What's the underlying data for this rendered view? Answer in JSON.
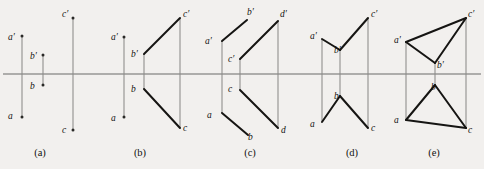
{
  "figure": {
    "background_color": "#f2f0ee",
    "axis_color": "#6b6a68",
    "edge_color": "#161513",
    "projector_color": "#8c8b89",
    "width": 484,
    "height": 169,
    "axis_y": 74
  },
  "panels": [
    {
      "id": "a",
      "caption": "(a)",
      "caption_x": 40,
      "caption_y": 156,
      "labels": [
        {
          "text": "a′",
          "x": 8,
          "y": 40
        },
        {
          "text": "b′",
          "x": 30,
          "y": 59
        },
        {
          "text": "b",
          "x": 30,
          "y": 89
        },
        {
          "text": "a",
          "x": 8,
          "y": 119
        },
        {
          "text": "c′",
          "x": 62,
          "y": 17
        },
        {
          "text": "c",
          "x": 62,
          "y": 133
        }
      ]
    },
    {
      "id": "b",
      "caption": "(b)",
      "caption_x": 140,
      "caption_y": 156,
      "labels": [
        {
          "text": "a′",
          "x": 111,
          "y": 40
        },
        {
          "text": "b′",
          "x": 131,
          "y": 57
        },
        {
          "text": "b",
          "x": 131,
          "y": 92
        },
        {
          "text": "a",
          "x": 111,
          "y": 121
        },
        {
          "text": "c′",
          "x": 183,
          "y": 17
        },
        {
          "text": "c",
          "x": 183,
          "y": 131
        }
      ]
    },
    {
      "id": "c",
      "caption": "(c)",
      "caption_x": 250,
      "caption_y": 156,
      "labels": [
        {
          "text": "a′",
          "x": 205,
          "y": 44
        },
        {
          "text": "b′",
          "x": 247,
          "y": 15
        },
        {
          "text": "c′",
          "x": 228,
          "y": 62
        },
        {
          "text": "c",
          "x": 228,
          "y": 92
        },
        {
          "text": "a",
          "x": 207,
          "y": 118
        },
        {
          "text": "b",
          "x": 248,
          "y": 140
        },
        {
          "text": "d′",
          "x": 280,
          "y": 17
        },
        {
          "text": "d",
          "x": 281,
          "y": 133
        }
      ]
    },
    {
      "id": "d",
      "caption": "(d)",
      "caption_x": 352,
      "caption_y": 156,
      "labels": [
        {
          "text": "a′",
          "x": 310,
          "y": 39
        },
        {
          "text": "b′",
          "x": 334,
          "y": 53
        },
        {
          "text": "b",
          "x": 334,
          "y": 99
        },
        {
          "text": "a",
          "x": 310,
          "y": 127
        },
        {
          "text": "c′",
          "x": 371,
          "y": 17
        },
        {
          "text": "c",
          "x": 371,
          "y": 131
        }
      ]
    },
    {
      "id": "e",
      "caption": "(e)",
      "caption_x": 434,
      "caption_y": 156,
      "labels": [
        {
          "text": "a′",
          "x": 394,
          "y": 43
        },
        {
          "text": "b′",
          "x": 437,
          "y": 68
        },
        {
          "text": "b",
          "x": 431,
          "y": 90
        },
        {
          "text": "a",
          "x": 394,
          "y": 123
        },
        {
          "text": "c′",
          "x": 468,
          "y": 17
        },
        {
          "text": "c",
          "x": 468,
          "y": 133
        }
      ]
    }
  ],
  "geometry": {
    "axis": {
      "x1": 3,
      "y1": 74,
      "x2": 481,
      "y2": 74
    },
    "panel_a": {
      "projectors": [
        {
          "x1": 22,
          "y1": 36,
          "x2": 22,
          "y2": 117
        },
        {
          "x1": 43,
          "y1": 55,
          "x2": 43,
          "y2": 85
        },
        {
          "x1": 73,
          "y1": 18,
          "x2": 73,
          "y2": 130
        }
      ],
      "edges": [],
      "dots": [
        {
          "x": 22,
          "y": 36
        },
        {
          "x": 22,
          "y": 117
        },
        {
          "x": 43,
          "y": 55
        },
        {
          "x": 43,
          "y": 85
        },
        {
          "x": 73,
          "y": 18
        },
        {
          "x": 73,
          "y": 130
        }
      ]
    },
    "panel_b": {
      "projectors": [
        {
          "x1": 124,
          "y1": 37,
          "x2": 124,
          "y2": 117
        },
        {
          "x1": 144,
          "y1": 54,
          "x2": 144,
          "y2": 89
        },
        {
          "x1": 180,
          "y1": 18,
          "x2": 180,
          "y2": 128
        }
      ],
      "edges": [
        {
          "x1": 144,
          "y1": 54,
          "x2": 180,
          "y2": 18
        },
        {
          "x1": 144,
          "y1": 89,
          "x2": 180,
          "y2": 128
        }
      ],
      "dots": [
        {
          "x": 124,
          "y": 37
        },
        {
          "x": 124,
          "y": 117
        }
      ]
    },
    "panel_c": {
      "projectors": [
        {
          "x1": 222,
          "y1": 41,
          "x2": 222,
          "y2": 113
        },
        {
          "x1": 240,
          "y1": 59,
          "x2": 240,
          "y2": 90
        },
        {
          "x1": 278,
          "y1": 21,
          "x2": 278,
          "y2": 128
        }
      ],
      "edges": [
        {
          "x1": 222,
          "y1": 41,
          "x2": 247,
          "y2": 20
        },
        {
          "x1": 240,
          "y1": 59,
          "x2": 278,
          "y2": 21
        },
        {
          "x1": 222,
          "y1": 113,
          "x2": 248,
          "y2": 135
        },
        {
          "x1": 240,
          "y1": 90,
          "x2": 278,
          "y2": 128
        }
      ],
      "dots": []
    },
    "panel_d": {
      "projectors": [
        {
          "x1": 322,
          "y1": 39,
          "x2": 322,
          "y2": 122
        },
        {
          "x1": 340,
          "y1": 50,
          "x2": 340,
          "y2": 96
        },
        {
          "x1": 368,
          "y1": 18,
          "x2": 368,
          "y2": 128
        }
      ],
      "edges": [
        {
          "x1": 322,
          "y1": 39,
          "x2": 340,
          "y2": 50
        },
        {
          "x1": 340,
          "y1": 50,
          "x2": 368,
          "y2": 18
        },
        {
          "x1": 322,
          "y1": 122,
          "x2": 340,
          "y2": 96
        },
        {
          "x1": 340,
          "y1": 96,
          "x2": 368,
          "y2": 128
        }
      ],
      "dots": []
    },
    "panel_e": {
      "projectors": [
        {
          "x1": 406,
          "y1": 42,
          "x2": 406,
          "y2": 120
        },
        {
          "x1": 435,
          "y1": 63,
          "x2": 435,
          "y2": 85
        },
        {
          "x1": 466,
          "y1": 18,
          "x2": 466,
          "y2": 128
        }
      ],
      "edges": [
        {
          "x1": 406,
          "y1": 42,
          "x2": 435,
          "y2": 63
        },
        {
          "x1": 435,
          "y1": 63,
          "x2": 466,
          "y2": 18
        },
        {
          "x1": 406,
          "y1": 42,
          "x2": 466,
          "y2": 18
        },
        {
          "x1": 406,
          "y1": 120,
          "x2": 435,
          "y2": 85
        },
        {
          "x1": 435,
          "y1": 85,
          "x2": 466,
          "y2": 128
        },
        {
          "x1": 406,
          "y1": 120,
          "x2": 466,
          "y2": 128
        }
      ],
      "dots": []
    }
  }
}
